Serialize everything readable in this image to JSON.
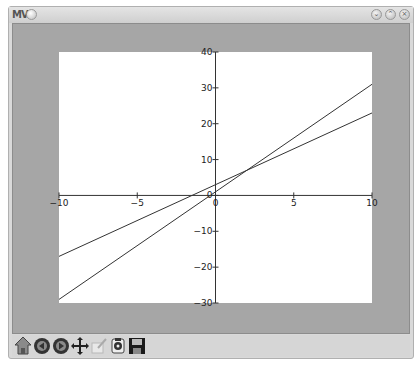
{
  "window": {
    "app_icon_glyph": "MV",
    "controls": [
      {
        "name": "minimize",
        "glyph": "⌄"
      },
      {
        "name": "maximize",
        "glyph": "⌃"
      },
      {
        "name": "close",
        "glyph": "×"
      }
    ]
  },
  "toolbar": {
    "buttons": [
      {
        "name": "home",
        "glyph": "⌂"
      },
      {
        "name": "back",
        "glyph": "◀"
      },
      {
        "name": "forward",
        "glyph": "▶"
      },
      {
        "name": "pan",
        "glyph": "✛"
      },
      {
        "name": "zoom",
        "glyph": "▭"
      },
      {
        "name": "configure-subplots",
        "glyph": "⚙"
      },
      {
        "name": "save",
        "glyph": "▣"
      }
    ]
  },
  "chart_data": {
    "type": "line",
    "title": "",
    "xlabel": "",
    "ylabel": "",
    "xlim": [
      -10,
      10
    ],
    "ylim": [
      -30,
      40
    ],
    "grid": false,
    "axes_through_origin": true,
    "xticks": [
      "-10",
      "-5",
      "0",
      "5",
      "10"
    ],
    "yticks": [
      "-30",
      "-20",
      "-10",
      "0",
      "10",
      "20",
      "30",
      "40"
    ],
    "series": [
      {
        "name": "line-1",
        "equation": "y = 2x + 3",
        "x": [
          -10,
          10
        ],
        "y": [
          -17,
          23
        ],
        "color": "#333333"
      },
      {
        "name": "line-2",
        "equation": "y = 3x + 1",
        "x": [
          -10,
          10
        ],
        "y": [
          -29,
          31
        ],
        "color": "#333333"
      }
    ],
    "intersection": {
      "x": 2,
      "y": 7
    }
  }
}
